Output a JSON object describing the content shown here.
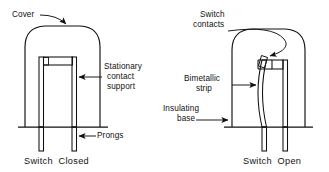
{
  "figure": {
    "line_color": "#111111",
    "background_color": "#ffffff",
    "panels": [
      {
        "id": "left",
        "caption": "Switch  Closed",
        "state": "closed",
        "labels": [
          {
            "id": "cover",
            "text": "Cover",
            "points_to": "dome-cover"
          },
          {
            "id": "stationary-contact-support",
            "line1": "Stationary",
            "line2": "contact",
            "line3": "support",
            "points_to": "contact-support-post"
          },
          {
            "id": "prongs",
            "text": "Prongs",
            "points_to": "prong"
          }
        ]
      },
      {
        "id": "right",
        "caption": "Switch  Open",
        "state": "open",
        "labels": [
          {
            "id": "switch-contacts",
            "line1": "Switch",
            "line2": "contacts",
            "points_to": "contact-pair"
          },
          {
            "id": "bimetallic-strip",
            "line1": "Bimetallic",
            "line2": "strip",
            "points_to": "bimetal-strip"
          },
          {
            "id": "insulating-base",
            "line1": "Insulating",
            "line2": "base",
            "points_to": "base-line"
          }
        ]
      }
    ]
  },
  "text": {
    "cover": "Cover",
    "stationary_1": "Stationary",
    "stationary_2": "contact",
    "stationary_3": "support",
    "prongs": "Prongs",
    "switch_contacts_1": "Switch",
    "switch_contacts_2": "contacts",
    "bimetallic_1": "Bimetallic",
    "bimetallic_2": "strip",
    "insulating_1": "Insulating",
    "insulating_2": "base",
    "caption_left": "Switch  Closed",
    "caption_right": "Switch  Open"
  }
}
